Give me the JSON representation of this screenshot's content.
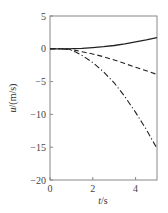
{
  "chart_data": {
    "type": "line",
    "title": "",
    "xlabel": "t/s",
    "ylabel": "u/(m/s)",
    "xlim": [
      0,
      5
    ],
    "ylim": [
      -20,
      5
    ],
    "xticks": [
      0,
      2,
      4
    ],
    "yticks": [
      5,
      0,
      -5,
      -10,
      -15,
      -20
    ],
    "grid": false,
    "legend": null,
    "series": [
      {
        "name": "solid",
        "style": "solid",
        "x": [
          0,
          0.5,
          1,
          1.5,
          2,
          2.5,
          3,
          3.5,
          4,
          4.5,
          5
        ],
        "y": [
          0,
          0,
          0.02,
          0.08,
          0.18,
          0.32,
          0.5,
          0.75,
          1.05,
          1.35,
          1.7
        ]
      },
      {
        "name": "dashed",
        "style": "dashed",
        "x": [
          0,
          0.5,
          0.9,
          1.2,
          1.5,
          2,
          2.5,
          3,
          3.5,
          4,
          4.5,
          5
        ],
        "y": [
          0,
          0,
          -0.05,
          -0.25,
          -0.45,
          -0.8,
          -1.2,
          -1.7,
          -2.25,
          -2.8,
          -3.35,
          -3.9
        ]
      },
      {
        "name": "dash-dot",
        "style": "dashdot",
        "x": [
          0,
          0.5,
          0.9,
          1.2,
          1.5,
          2,
          2.5,
          3,
          3.5,
          4,
          4.5,
          5
        ],
        "y": [
          0,
          0,
          -0.1,
          -0.5,
          -1.0,
          -2.1,
          -3.5,
          -5.2,
          -7.3,
          -9.7,
          -12.3,
          -15.2
        ]
      }
    ]
  },
  "axes": {
    "x_tick_labels": [
      "0",
      "2",
      "4"
    ],
    "y_tick_labels": [
      "5",
      "0",
      "−5",
      "−10",
      "−15",
      "−20"
    ],
    "x_label": "t/s",
    "y_label": "u/(m/s)"
  },
  "colors": {
    "line": "#222222",
    "axis": "#888888"
  }
}
